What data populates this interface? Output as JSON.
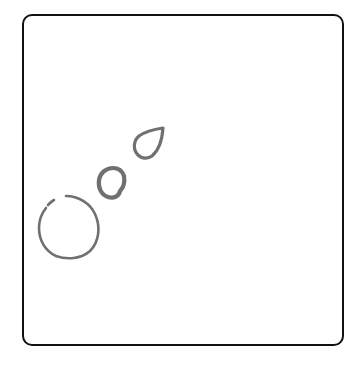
{
  "canvas": {
    "frame_border_color": "#111111",
    "background_color": "#ffffff",
    "stroke_color": "#707070",
    "shapes": [
      {
        "name": "teardrop",
        "kind": "closed-stroke"
      },
      {
        "name": "small-blob",
        "kind": "closed-stroke"
      },
      {
        "name": "large-open-circle",
        "kind": "open-stroke"
      }
    ]
  }
}
